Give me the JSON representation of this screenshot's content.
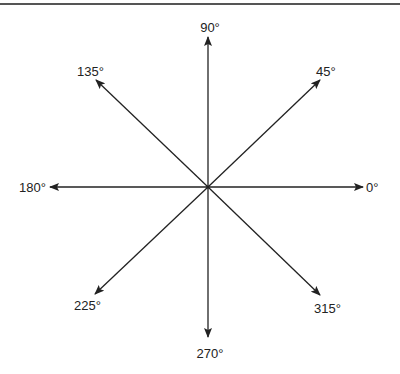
{
  "diagram": {
    "title": "",
    "center": {
      "x": 208,
      "y": 187
    },
    "stroke_color": "#222222",
    "rule_color": "#555555",
    "arrows": [
      {
        "angle": "0°",
        "tip": {
          "x": 363,
          "y": 187
        },
        "label": {
          "text": "0°",
          "x": 366,
          "y": 192,
          "anchor": "start"
        }
      },
      {
        "angle": "45°",
        "tip": {
          "x": 320,
          "y": 80
        },
        "label": {
          "text": "45°",
          "x": 316,
          "y": 76,
          "anchor": "start"
        }
      },
      {
        "angle": "90°",
        "tip": {
          "x": 208,
          "y": 37
        },
        "label": {
          "text": "90°",
          "x": 210,
          "y": 32,
          "anchor": "middle"
        }
      },
      {
        "angle": "135°",
        "tip": {
          "x": 96,
          "y": 80
        },
        "label": {
          "text": "135°",
          "x": 104,
          "y": 76,
          "anchor": "end"
        }
      },
      {
        "angle": "180°",
        "tip": {
          "x": 50,
          "y": 187
        },
        "label": {
          "text": "180°",
          "x": 46,
          "y": 192,
          "anchor": "end"
        }
      },
      {
        "angle": "225°",
        "tip": {
          "x": 95,
          "y": 294
        },
        "label": {
          "text": "225°",
          "x": 74,
          "y": 310,
          "anchor": "start"
        }
      },
      {
        "angle": "270°",
        "tip": {
          "x": 208,
          "y": 337
        },
        "label": {
          "text": "270°",
          "x": 210,
          "y": 358,
          "anchor": "middle"
        }
      },
      {
        "angle": "315°",
        "tip": {
          "x": 320,
          "y": 295
        },
        "label": {
          "text": "315°",
          "x": 314,
          "y": 313,
          "anchor": "start"
        }
      }
    ]
  }
}
